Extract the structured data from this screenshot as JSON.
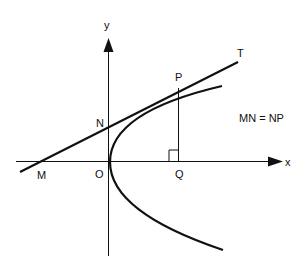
{
  "diagram": {
    "colors": {
      "stroke": "#111111",
      "background": "#ffffff"
    },
    "axes": {
      "x_label": "x",
      "y_label": "y"
    },
    "points": {
      "M": "M",
      "N": "N",
      "O": "O",
      "P": "P",
      "Q": "Q",
      "T": "T"
    },
    "annotation": "MN = NP"
  }
}
